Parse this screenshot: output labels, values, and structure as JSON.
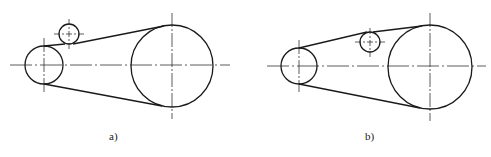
{
  "figure": {
    "stroke_color": "#1a1a1a",
    "centerline_color": "#333333",
    "diagrams": [
      {
        "id": "a",
        "label": "a)",
        "description": "Belt drive with idler pulley pressing on outside of slack (upper) span, near small pulley",
        "small_pulley": {
          "cx": 44,
          "cy": 65,
          "r": 19
        },
        "idler_pulley": {
          "cx": 69,
          "cy": 34,
          "r": 10,
          "position": "outside-belt-below-idler"
        },
        "large_pulley": {
          "cx": 172,
          "cy": 66,
          "r": 41
        },
        "centerline_h": {
          "x1": 10,
          "x2": 230,
          "y": 65
        }
      },
      {
        "id": "b",
        "label": "b)",
        "description": "Belt drive with idler pulley inside belt loop on upper span, near large pulley",
        "small_pulley": {
          "cx": 299,
          "cy": 66,
          "r": 18
        },
        "idler_pulley": {
          "cx": 370,
          "cy": 42,
          "r": 10,
          "position": "inside-belt"
        },
        "large_pulley": {
          "cx": 430,
          "cy": 67,
          "r": 42
        },
        "centerline_h": {
          "x1": 267,
          "x2": 486,
          "y": 66
        }
      }
    ]
  }
}
